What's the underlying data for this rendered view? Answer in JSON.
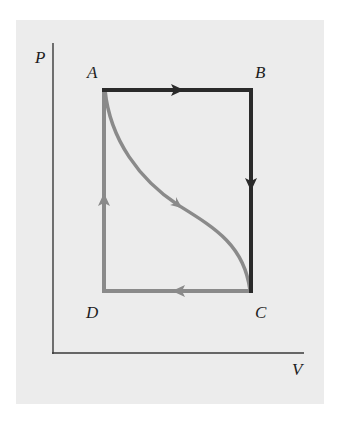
{
  "diagram": {
    "type": "PV cycle diagram",
    "axes": {
      "y_label": "P",
      "x_label": "V"
    },
    "points": [
      {
        "id": "A",
        "label": "A",
        "x": 104,
        "y": 90
      },
      {
        "id": "B",
        "label": "B",
        "x": 251,
        "y": 90
      },
      {
        "id": "C",
        "label": "C",
        "x": 251,
        "y": 291
      },
      {
        "id": "D",
        "label": "D",
        "x": 104,
        "y": 291
      }
    ],
    "paths": [
      {
        "from": "A",
        "to": "B",
        "shape": "straight",
        "direction": "right",
        "color": "#2a2a2a"
      },
      {
        "from": "B",
        "to": "C",
        "shape": "straight",
        "direction": "down",
        "color": "#2a2a2a"
      },
      {
        "from": "C",
        "to": "D",
        "shape": "straight",
        "direction": "left",
        "color": "#8a8a8a"
      },
      {
        "from": "D",
        "to": "A",
        "shape": "straight",
        "direction": "up",
        "color": "#8a8a8a"
      },
      {
        "from": "A",
        "to": "C",
        "shape": "curve",
        "direction": "down-right",
        "color": "#8a8a8a"
      }
    ],
    "colors": {
      "background": "#ffffff",
      "panel": "#ececec",
      "dark_path": "#2a2a2a",
      "light_path": "#8a8a8a",
      "axis": "#3a3a3a"
    }
  }
}
